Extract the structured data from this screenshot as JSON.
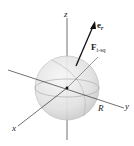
{
  "diagram": {
    "axes": {
      "z": "z",
      "y": "y",
      "x": "x"
    },
    "radius_label": "R",
    "unit_vector": {
      "symbol": "e",
      "subscript": "r"
    },
    "force": {
      "symbol": "F",
      "subscript": "i-sq"
    },
    "colors": {
      "sphere_fill": "#e4e4e4",
      "sphere_edge": "#b8b8b8",
      "axis": "#333333",
      "arrow": "#111111"
    }
  }
}
